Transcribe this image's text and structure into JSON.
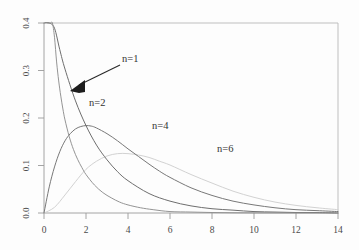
{
  "chart_data": {
    "type": "line",
    "title": "",
    "subtitle": "",
    "xlabel": "",
    "ylabel": "",
    "xlim": [
      0,
      14
    ],
    "ylim": [
      0.0,
      0.4
    ],
    "xticks": [
      "0",
      "2",
      "4",
      "6",
      "8",
      "10",
      "12",
      "14"
    ],
    "xtick_values": [
      0,
      2,
      4,
      6,
      8,
      10,
      12,
      14
    ],
    "yticks": [
      "0.0",
      "0.1",
      "0.2",
      "0.3",
      "0.4"
    ],
    "ytick_values": [
      0.0,
      0.1,
      0.2,
      0.3,
      0.4
    ],
    "ytick_rotation_deg": -90,
    "grid": false,
    "legend_position": "inline-annotations",
    "series": [
      {
        "name": "n=1",
        "label": "n=1",
        "color": "#8e8e8e",
        "label_x": 3.9,
        "label_y": 0.318,
        "x": [
          0.15,
          0.2,
          0.3,
          0.4,
          0.5,
          0.6,
          0.7,
          0.8,
          0.9,
          1.0,
          1.2,
          1.4,
          1.6,
          1.8,
          2.0,
          2.4,
          2.8,
          3.2,
          3.6,
          4.0,
          4.6,
          5.2,
          6.0,
          7.0,
          8.0,
          9.0,
          10.0,
          11.0,
          12.0,
          13.0,
          14.0
        ],
        "y": [
          0.848,
          0.713,
          0.541,
          0.44,
          0.37,
          0.318,
          0.278,
          0.246,
          0.219,
          0.196,
          0.161,
          0.134,
          0.113,
          0.096,
          0.081,
          0.059,
          0.043,
          0.032,
          0.023,
          0.017,
          0.011,
          0.007,
          0.003,
          0.002,
          0.001,
          0.0005,
          0.0003,
          0.0002,
          0.0001,
          0.0001,
          0.0
        ]
      },
      {
        "name": "n=2",
        "label": "n=2",
        "color": "#6e6e6e",
        "label_x": 2.15,
        "label_y": 0.225,
        "x": [
          0.0,
          0.25,
          0.5,
          0.75,
          1.0,
          1.5,
          2.0,
          2.5,
          3.0,
          3.5,
          4.0,
          5.0,
          6.0,
          7.0,
          8.0,
          9.0,
          10.0,
          11.0,
          12.0,
          13.0,
          14.0
        ],
        "y": [
          0.5,
          0.441,
          0.389,
          0.344,
          0.303,
          0.236,
          0.184,
          0.143,
          0.112,
          0.087,
          0.068,
          0.041,
          0.025,
          0.015,
          0.009,
          0.006,
          0.003,
          0.002,
          0.001,
          0.001,
          0.0
        ]
      },
      {
        "name": "n=4",
        "label": "n=4",
        "color": "#787878",
        "label_x": 5.15,
        "label_y": 0.176,
        "peak_x": 2.0,
        "peak_y": 0.184,
        "x": [
          0.0,
          0.25,
          0.5,
          0.75,
          1.0,
          1.25,
          1.5,
          1.75,
          2.0,
          2.25,
          2.5,
          3.0,
          3.5,
          4.0,
          4.5,
          5.0,
          5.5,
          6.0,
          7.0,
          8.0,
          9.0,
          10.0,
          11.0,
          12.0,
          13.0,
          14.0
        ],
        "y": [
          0.0,
          0.055,
          0.097,
          0.129,
          0.152,
          0.167,
          0.177,
          0.182,
          0.184,
          0.183,
          0.179,
          0.167,
          0.152,
          0.135,
          0.119,
          0.103,
          0.088,
          0.075,
          0.053,
          0.037,
          0.025,
          0.017,
          0.011,
          0.007,
          0.005,
          0.003
        ]
      },
      {
        "name": "n=6",
        "label": "n=6",
        "color": "#d2d2d2",
        "label_x": 8.25,
        "label_y": 0.128,
        "peak_x": 4.0,
        "peak_y": 0.125,
        "x": [
          0.0,
          0.5,
          1.0,
          1.5,
          2.0,
          2.5,
          3.0,
          3.5,
          4.0,
          4.5,
          5.0,
          5.5,
          6.0,
          7.0,
          8.0,
          9.0,
          10.0,
          11.0,
          12.0,
          13.0,
          14.0
        ],
        "y": [
          0.0,
          0.012,
          0.038,
          0.066,
          0.092,
          0.109,
          0.12,
          0.125,
          0.125,
          0.122,
          0.117,
          0.109,
          0.101,
          0.081,
          0.063,
          0.046,
          0.033,
          0.023,
          0.016,
          0.011,
          0.007
        ]
      }
    ],
    "annotations": [
      {
        "name": "n1-arrow",
        "text": "n=1",
        "from_x": 3.85,
        "from_y": 0.312,
        "to_x": 1.55,
        "to_y": 0.268
      }
    ]
  },
  "axes": {
    "x_tick_labels": [
      "0",
      "2",
      "4",
      "6",
      "8",
      "10",
      "12",
      "14"
    ],
    "y_tick_labels": [
      "0.0",
      "0.1",
      "0.2",
      "0.3",
      "0.4"
    ]
  },
  "colors": {
    "background": "#fdfdfd",
    "axis": "#9a9a9a",
    "frame": "#b8b8b8",
    "text": "#3a3a3a",
    "annotation": "#1d1d1d"
  }
}
